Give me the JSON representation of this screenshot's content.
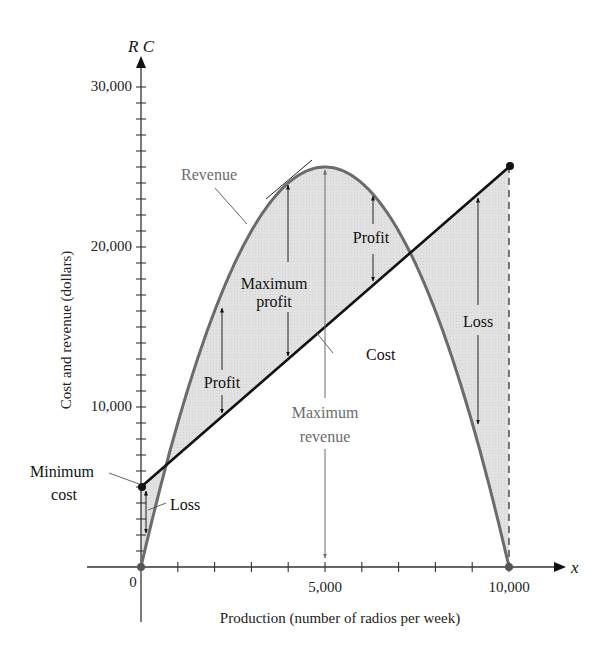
{
  "chart_data": {
    "type": "line",
    "title": "",
    "xlabel": "Production (number of radios per week)",
    "ylabel": "Cost and revenue (dollars)",
    "x_axis_var": "x",
    "y_axis_var": "R C",
    "xlim": [
      0,
      10000
    ],
    "ylim": [
      0,
      30000
    ],
    "x_ticks": {
      "step": 1000,
      "labels": [
        {
          "value": 0,
          "label": "0"
        },
        {
          "value": 5000,
          "label": "5,000"
        },
        {
          "value": 10000,
          "label": "10,000"
        }
      ]
    },
    "y_ticks": {
      "step": 1000,
      "labels": [
        {
          "value": 10000,
          "label": "10,000"
        },
        {
          "value": 20000,
          "label": "20,000"
        },
        {
          "value": 30000,
          "label": "30,000"
        }
      ]
    },
    "grid": false,
    "series": [
      {
        "name": "Revenue",
        "formula": "R = 10x - 0.001x^2",
        "color": "#6b6b6b",
        "x": [
          0,
          1000,
          2000,
          3000,
          4000,
          5000,
          6000,
          7000,
          8000,
          9000,
          10000
        ],
        "values": [
          0,
          9000,
          16000,
          21000,
          24000,
          25000,
          24000,
          21000,
          16000,
          9000,
          0
        ]
      },
      {
        "name": "Cost",
        "formula": "C = 5000 + 2x",
        "color": "#111111",
        "x": [
          0,
          10000
        ],
        "values": [
          5000,
          25000
        ]
      }
    ],
    "key_points": [
      {
        "name": "Minimum cost",
        "x": 0,
        "y": 5000
      },
      {
        "name": "Maximum revenue",
        "x": 5000,
        "y": 25000
      },
      {
        "name": "Maximum profit",
        "x": 4000,
        "revenue": 24000,
        "cost": 13000
      },
      {
        "name": "Break-even 1",
        "x": 683,
        "y": 6367
      },
      {
        "name": "Break-even 2",
        "x": 7317,
        "y": 19633
      },
      {
        "name": "End of cost line",
        "x": 10000,
        "y": 25000
      }
    ],
    "annotations": [
      {
        "text": "Revenue",
        "color": "#6b6b6b"
      },
      {
        "text": "Cost",
        "color": "#111111"
      },
      {
        "text": "Maximum profit",
        "color": "#111111"
      },
      {
        "text": "Profit",
        "color": "#111111",
        "position": "left region"
      },
      {
        "text": "Profit",
        "color": "#111111",
        "position": "right region"
      },
      {
        "text": "Maximum revenue",
        "color": "#6b6b6b"
      },
      {
        "text": "Minimum cost",
        "color": "#111111"
      },
      {
        "text": "Loss",
        "color": "#111111",
        "position": "left region"
      },
      {
        "text": "Loss",
        "color": "#111111",
        "position": "right region"
      }
    ],
    "shading": {
      "color": "#dcdcdc",
      "description": "Region between revenue curve and cost line"
    }
  },
  "labels": {
    "y_var": "R C",
    "x_var": "x",
    "y_axis_title": "Cost and revenue (dollars)",
    "x_axis_title": "Production (number of radios per week)",
    "y30": "30,000",
    "y20": "20,000",
    "y10": "10,000",
    "x0": "0",
    "x5": "5,000",
    "x10": "10,000",
    "revenue": "Revenue",
    "cost": "Cost",
    "max_profit_1": "Maximum",
    "max_profit_2": "profit",
    "profit_left": "Profit",
    "profit_right": "Profit",
    "max_rev_1": "Maximum",
    "max_rev_2": "revenue",
    "min_cost_1": "Minimum",
    "min_cost_2": "cost",
    "loss_left": "Loss",
    "loss_right": "Loss"
  }
}
